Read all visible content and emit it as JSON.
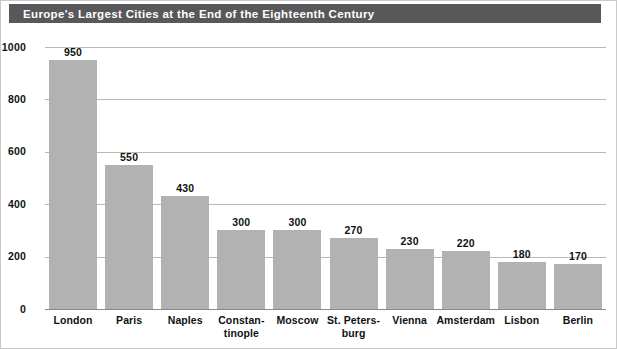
{
  "title": "Europe's Largest Cities at the End of the Eighteenth Century",
  "colors": {
    "title_bar": "#58585a",
    "title_text": "#ffffff",
    "bar_fill": "#b2b2b2",
    "gridline": "#b8b8b8",
    "axis": "#8a8a8a",
    "text": "#111111",
    "background": "#ffffff"
  },
  "chart_data": {
    "type": "bar",
    "title": "Europe's Largest Cities at the End of the Eighteenth Century",
    "xlabel": "",
    "ylabel": "POPULATION (IN THOUSANDS)",
    "categories": [
      "London",
      "Paris",
      "Naples",
      "Constan-\ntinople",
      "Moscow",
      "St. Peters-\nburg",
      "Vienna",
      "Amsterdam",
      "Lisbon",
      "Berlin"
    ],
    "category_lines": [
      [
        "London"
      ],
      [
        "Paris"
      ],
      [
        "Naples"
      ],
      [
        "Constan-",
        "tinople"
      ],
      [
        "Moscow"
      ],
      [
        "St. Peters-",
        "burg"
      ],
      [
        "Vienna"
      ],
      [
        "Amsterdam"
      ],
      [
        "Lisbon"
      ],
      [
        "Berlin"
      ]
    ],
    "values": [
      950,
      550,
      430,
      300,
      300,
      270,
      230,
      220,
      180,
      170
    ],
    "value_labels": [
      "950",
      "550",
      "430",
      "300",
      "300",
      "270",
      "230",
      "220",
      "180",
      "170"
    ],
    "ylim": [
      0,
      1000
    ],
    "yticks": [
      0,
      200,
      400,
      600,
      800,
      1000
    ],
    "ytick_labels": [
      "0",
      "200",
      "400",
      "600",
      "800",
      "1000"
    ],
    "grid": true,
    "grid_axis": "y",
    "legend": false,
    "legend_position": "none"
  }
}
